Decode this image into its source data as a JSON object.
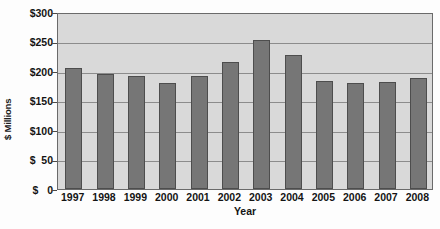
{
  "chart_data": {
    "type": "bar",
    "title": "",
    "xlabel": "Year",
    "ylabel": "$ Millions",
    "categories": [
      "1997",
      "1998",
      "1999",
      "2000",
      "2001",
      "2002",
      "2003",
      "2004",
      "2005",
      "2006",
      "2007",
      "2008"
    ],
    "values": [
      205,
      195,
      192,
      180,
      191,
      215,
      252,
      227,
      183,
      179,
      181,
      188
    ],
    "series": [
      {
        "name": "",
        "values": [
          205,
          195,
          192,
          180,
          191,
          215,
          252,
          227,
          183,
          179,
          181,
          188
        ]
      }
    ],
    "ylim": [
      0,
      300
    ],
    "ytick_values": [
      0,
      50,
      100,
      150,
      200,
      250,
      300
    ],
    "ytick_labels": [
      "$   0",
      "$  50",
      "$100",
      "$150",
      "$200",
      "$250",
      "$300"
    ],
    "grid": true,
    "grid_axis": "y",
    "legend": false,
    "legend_position": "none",
    "bar_color": "#767676",
    "bar_edge_color": "#4d4d4d",
    "plot_background_color": "#d9d9d9",
    "gridline_color": "#8c8c8c",
    "frame_color": "#6a6a6a",
    "figure_background_color": "#fdfdfd"
  }
}
